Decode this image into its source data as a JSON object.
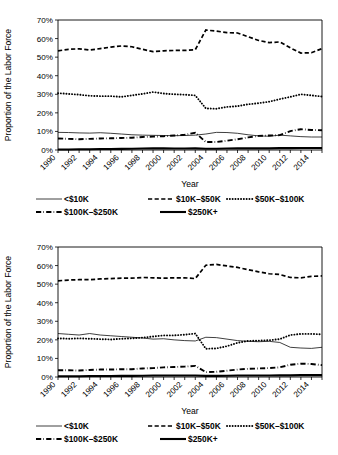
{
  "page": {
    "background": "#ffffff",
    "ink": "#000000"
  },
  "axis": {
    "ylabel": "Proportion of the Labor Force",
    "xlabel": "Year",
    "yticks": [
      "0%",
      "10%",
      "20%",
      "30%",
      "40%",
      "50%",
      "60%",
      "70%"
    ],
    "xticks": [
      "1990",
      "1992",
      "1994",
      "1996",
      "1998",
      "2000",
      "2002",
      "2004",
      "2006",
      "2008",
      "2010",
      "2012",
      "2014"
    ]
  },
  "legend": {
    "items": [
      {
        "label": "<$10K",
        "style": "thin-solid"
      },
      {
        "label": "$10K–$50K",
        "style": "dashed"
      },
      {
        "label": "$50K–$100K",
        "style": "dotted"
      },
      {
        "label": "$100K–$250K",
        "style": "dash-dot"
      },
      {
        "label": "$250K+",
        "style": "thick-solid"
      }
    ]
  },
  "chart_data": [
    {
      "type": "line",
      "title": "",
      "xlabel": "Year",
      "ylabel": "Proportion of the Labor Force",
      "ylim": [
        0,
        70
      ],
      "xlim": [
        1990,
        2015
      ],
      "grid": false,
      "legend_position": "bottom",
      "x": [
        1990,
        1991,
        1992,
        1993,
        1994,
        1995,
        1996,
        1997,
        1998,
        1999,
        2000,
        2001,
        2002,
        2003,
        2004,
        2005,
        2006,
        2007,
        2008,
        2009,
        2010,
        2011,
        2012,
        2013,
        2014,
        2015
      ],
      "series": [
        {
          "name": "<$10K",
          "style": "thin-solid",
          "values": [
            9.5,
            9.4,
            9.2,
            9.1,
            9.3,
            9.0,
            8.6,
            8.2,
            8.0,
            7.9,
            7.8,
            7.7,
            7.8,
            8.0,
            8.6,
            9.5,
            9.4,
            9.0,
            8.2,
            7.6,
            7.4,
            8.0,
            7.6,
            7.2,
            7.0,
            7.0
          ]
        },
        {
          "name": "$10K–$50K",
          "style": "dashed",
          "values": [
            53.4,
            54.2,
            54.5,
            53.8,
            54.6,
            55.4,
            56.0,
            55.6,
            54.2,
            53.0,
            53.4,
            53.6,
            53.6,
            54.0,
            64.6,
            64.0,
            63.2,
            63.0,
            61.0,
            59.0,
            57.8,
            58.2,
            55.0,
            52.2,
            52.4,
            54.6
          ]
        },
        {
          "name": "$50K–$100K",
          "style": "dotted",
          "values": [
            30.6,
            30.2,
            29.8,
            29.2,
            29.0,
            29.0,
            28.6,
            29.4,
            30.2,
            31.2,
            30.4,
            30.0,
            29.8,
            29.4,
            22.4,
            22.2,
            23.2,
            23.6,
            24.6,
            25.2,
            26.0,
            27.4,
            28.6,
            30.0,
            29.4,
            28.8
          ]
        },
        {
          "name": "$100K–$250K",
          "style": "dash-dot",
          "values": [
            6.2,
            6.0,
            5.8,
            6.0,
            6.2,
            6.3,
            6.5,
            6.6,
            7.0,
            7.2,
            7.4,
            7.8,
            8.2,
            9.3,
            4.3,
            4.3,
            5.0,
            5.8,
            6.8,
            7.6,
            7.8,
            8.0,
            10.2,
            11.2,
            10.8,
            10.6
          ]
        },
        {
          "name": "$250K+",
          "style": "thick-solid",
          "values": [
            0.3,
            0.3,
            0.4,
            0.4,
            0.5,
            0.5,
            0.6,
            0.7,
            0.8,
            0.9,
            0.9,
            0.8,
            0.8,
            0.9,
            0.7,
            0.7,
            0.8,
            0.9,
            0.9,
            0.9,
            0.9,
            1.0,
            1.0,
            1.1,
            1.1,
            1.1
          ]
        }
      ]
    },
    {
      "type": "line",
      "title": "",
      "xlabel": "Year",
      "ylabel": "Proportion of the Labor Force",
      "ylim": [
        0,
        70
      ],
      "xlim": [
        1990,
        2015
      ],
      "grid": false,
      "legend_position": "bottom",
      "x": [
        1990,
        1991,
        1992,
        1993,
        1994,
        1995,
        1996,
        1997,
        1998,
        1999,
        2000,
        2001,
        2002,
        2003,
        2004,
        2005,
        2006,
        2007,
        2008,
        2009,
        2010,
        2011,
        2012,
        2013,
        2014,
        2015
      ],
      "series": [
        {
          "name": "<$10K",
          "style": "thin-solid",
          "values": [
            23.4,
            23.0,
            22.6,
            23.4,
            22.6,
            22.2,
            21.8,
            21.4,
            21.0,
            20.4,
            20.6,
            20.0,
            19.6,
            19.4,
            21.4,
            21.2,
            20.4,
            19.6,
            19.2,
            19.0,
            19.2,
            18.6,
            16.0,
            15.6,
            15.4,
            16.0
          ]
        },
        {
          "name": "$10K–$50K",
          "style": "dashed",
          "values": [
            51.8,
            52.2,
            52.4,
            52.4,
            52.8,
            53.0,
            53.2,
            53.2,
            53.6,
            53.4,
            53.2,
            53.4,
            53.4,
            53.0,
            60.2,
            60.6,
            59.8,
            59.0,
            57.8,
            56.6,
            55.6,
            55.2,
            53.6,
            53.4,
            54.2,
            54.4
          ]
        },
        {
          "name": "$50K–$100K",
          "style": "dotted",
          "values": [
            20.8,
            20.6,
            20.8,
            20.6,
            20.4,
            20.2,
            20.6,
            20.8,
            21.2,
            21.8,
            22.4,
            22.4,
            22.8,
            23.4,
            15.2,
            15.4,
            16.6,
            18.4,
            19.4,
            19.6,
            19.8,
            20.4,
            22.6,
            23.2,
            23.2,
            23.0
          ]
        },
        {
          "name": "$100K–$250K",
          "style": "dash-dot",
          "values": [
            3.6,
            3.6,
            3.5,
            3.8,
            4.0,
            4.0,
            4.2,
            4.2,
            4.6,
            4.8,
            5.2,
            5.4,
            5.6,
            6.0,
            2.6,
            2.8,
            3.4,
            4.0,
            4.4,
            4.6,
            4.8,
            5.2,
            6.6,
            7.2,
            7.0,
            6.4
          ]
        },
        {
          "name": "$250K+",
          "style": "thick-solid",
          "values": [
            0.4,
            0.4,
            0.4,
            0.5,
            0.5,
            0.5,
            0.6,
            0.6,
            0.7,
            0.8,
            0.8,
            0.8,
            0.8,
            0.8,
            0.6,
            0.6,
            0.7,
            0.8,
            0.8,
            0.8,
            0.8,
            0.9,
            0.9,
            1.0,
            1.0,
            1.0
          ]
        }
      ]
    }
  ]
}
